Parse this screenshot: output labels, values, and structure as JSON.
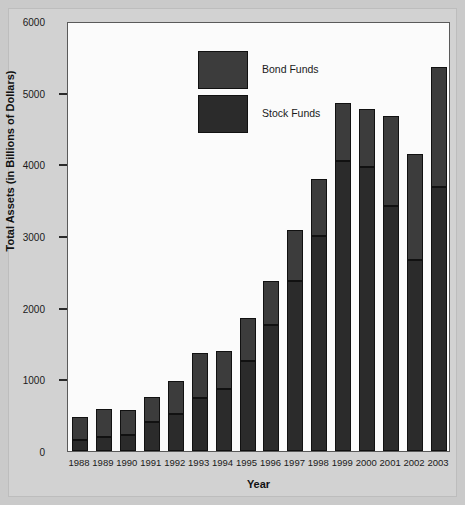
{
  "chart_data": {
    "type": "bar",
    "stacked": true,
    "title": "",
    "xlabel": "Year",
    "ylabel": "Total Assets (in Billions of Dollars)",
    "ylim": [
      0,
      6000
    ],
    "yticks": [
      0,
      1000,
      2000,
      3000,
      4000,
      5000,
      6000
    ],
    "ytick_labels": [
      "0",
      "1000",
      "2000",
      "3000",
      "4000",
      "5000",
      "6000"
    ],
    "grid": false,
    "legend_position": "upper-left-inside",
    "categories": [
      "1988",
      "1989",
      "1990",
      "1991",
      "1992",
      "1993",
      "1994",
      "1995",
      "1996",
      "1997",
      "1998",
      "1999",
      "2000",
      "2001",
      "2002",
      "2003"
    ],
    "series": [
      {
        "name": "Stock Funds",
        "color": "#2b2b2b",
        "values": [
          150,
          200,
          230,
          400,
          520,
          740,
          870,
          1250,
          1760,
          2370,
          3000,
          4050,
          3960,
          3420,
          2670,
          3680
        ]
      },
      {
        "name": "Bond Funds",
        "color": "#3c3c3c",
        "values": [
          330,
          380,
          340,
          360,
          460,
          630,
          530,
          600,
          610,
          720,
          800,
          810,
          810,
          1260,
          1470,
          1680
        ]
      }
    ],
    "totals": [
      480,
      580,
      570,
      760,
      980,
      1370,
      1400,
      1850,
      2370,
      3090,
      3800,
      4860,
      4770,
      4680,
      4140,
      5360
    ]
  },
  "legend": {
    "entries": [
      {
        "label": "Bond Funds",
        "swatch_name": "bond-funds-swatch"
      },
      {
        "label": "Stock Funds",
        "swatch_name": "stock-funds-swatch"
      }
    ]
  },
  "colors": {
    "background": "#cacaca",
    "panel": "#d2d2d2",
    "plot_background": "#fbfbfb",
    "axis": "#5a5a5a",
    "bond": "#3c3c3c",
    "stock": "#2b2b2b"
  }
}
